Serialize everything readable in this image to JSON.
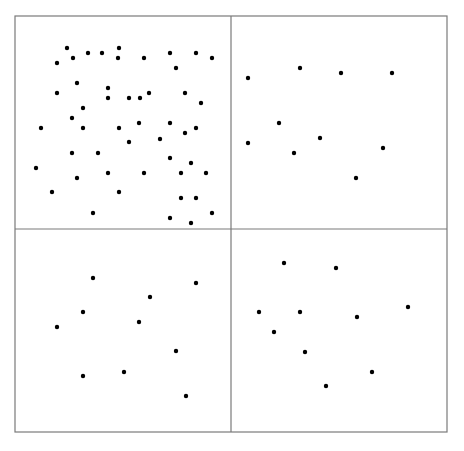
{
  "diagram": {
    "type": "quadrant-dot-density",
    "frame": {
      "x": 15,
      "y": 16,
      "width": 432,
      "height": 416
    },
    "dividers": {
      "vertical_x": 231,
      "horizontal_y": 229
    },
    "colors": {
      "border": "#7a7a7a",
      "dot": "#000000",
      "background": "#ffffff"
    },
    "dot_radius": 2.2,
    "quadrants": [
      {
        "name": "top-left",
        "dot_count": 57,
        "dots": [
          [
            67,
            48
          ],
          [
            73,
            58
          ],
          [
            88,
            53
          ],
          [
            102,
            53
          ],
          [
            119,
            48
          ],
          [
            118,
            58
          ],
          [
            57,
            63
          ],
          [
            144,
            58
          ],
          [
            170,
            53
          ],
          [
            196,
            53
          ],
          [
            212,
            58
          ],
          [
            176,
            68
          ],
          [
            77,
            83
          ],
          [
            57,
            93
          ],
          [
            108,
            88
          ],
          [
            108,
            98
          ],
          [
            83,
            108
          ],
          [
            129,
            98
          ],
          [
            140,
            98
          ],
          [
            149,
            93
          ],
          [
            185,
            93
          ],
          [
            201,
            103
          ],
          [
            72,
            118
          ],
          [
            41,
            128
          ],
          [
            83,
            128
          ],
          [
            119,
            128
          ],
          [
            139,
            123
          ],
          [
            170,
            123
          ],
          [
            185,
            133
          ],
          [
            196,
            128
          ],
          [
            129,
            142
          ],
          [
            160,
            139
          ],
          [
            72,
            153
          ],
          [
            98,
            153
          ],
          [
            170,
            158
          ],
          [
            191,
            163
          ],
          [
            36,
            168
          ],
          [
            108,
            173
          ],
          [
            144,
            173
          ],
          [
            181,
            173
          ],
          [
            206,
            173
          ],
          [
            77,
            178
          ],
          [
            52,
            192
          ],
          [
            119,
            192
          ],
          [
            181,
            198
          ],
          [
            196,
            198
          ],
          [
            93,
            213
          ],
          [
            212,
            213
          ],
          [
            170,
            218
          ],
          [
            191,
            223
          ]
        ]
      },
      {
        "name": "top-right",
        "dot_count": 10,
        "dots": [
          [
            248,
            78
          ],
          [
            300,
            68
          ],
          [
            341,
            73
          ],
          [
            392,
            73
          ],
          [
            279,
            123
          ],
          [
            248,
            143
          ],
          [
            320,
            138
          ],
          [
            294,
            153
          ],
          [
            383,
            148
          ],
          [
            356,
            178
          ]
        ]
      },
      {
        "name": "bottom-left",
        "dot_count": 10,
        "dots": [
          [
            93,
            278
          ],
          [
            196,
            283
          ],
          [
            150,
            297
          ],
          [
            83,
            312
          ],
          [
            139,
            322
          ],
          [
            57,
            327
          ],
          [
            176,
            351
          ],
          [
            124,
            372
          ],
          [
            83,
            376
          ],
          [
            186,
            396
          ]
        ]
      },
      {
        "name": "bottom-right",
        "dot_count": 10,
        "dots": [
          [
            284,
            263
          ],
          [
            336,
            268
          ],
          [
            259,
            312
          ],
          [
            300,
            312
          ],
          [
            357,
            317
          ],
          [
            408,
            307
          ],
          [
            274,
            332
          ],
          [
            305,
            352
          ],
          [
            372,
            372
          ],
          [
            326,
            386
          ]
        ]
      }
    ]
  }
}
